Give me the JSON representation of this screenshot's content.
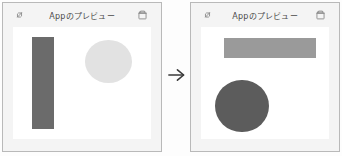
{
  "panels": [
    {
      "id": "left",
      "titlebar": {
        "expand_icon": "expand-diagonal-icon",
        "title": "Appのプレビュー",
        "trash_icon": "trash-icon"
      },
      "shapes": [
        {
          "name": "tall-rectangle",
          "kind": "rect",
          "color": "#6b6b6b"
        },
        {
          "name": "light-circle",
          "kind": "circle",
          "color": "#e2e2e2"
        }
      ]
    },
    {
      "id": "right",
      "titlebar": {
        "expand_icon": "expand-diagonal-icon",
        "title": "Appのプレビュー",
        "trash_icon": "trash-icon"
      },
      "shapes": [
        {
          "name": "wide-rectangle",
          "kind": "rect",
          "color": "#9a9a9a"
        },
        {
          "name": "dark-circle",
          "kind": "circle",
          "color": "#5c5c5c"
        }
      ]
    }
  ],
  "transition": {
    "icon": "arrow-right-icon",
    "label": "→"
  },
  "colors": {
    "panel_background": "#f4f4f4",
    "panel_border": "#b9b9b9",
    "canvas_background": "#ffffff",
    "title_text": "#4a4a4a",
    "icon_stroke": "#8a8a8a"
  }
}
